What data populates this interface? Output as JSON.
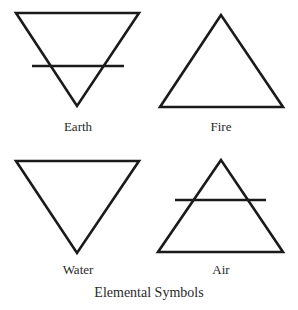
{
  "diagram": {
    "caption": "Elemental Symbols",
    "stroke_color": "#1a1a1a",
    "background_color": "#ffffff",
    "symbols": [
      {
        "name": "Earth",
        "label": "Earth",
        "shape": "downward-triangle-with-crossbar",
        "triangle_points": [
          [
            16,
            13
          ],
          [
            139,
            13
          ],
          [
            77,
            106
          ]
        ],
        "crossbar": [
          [
            32,
            66
          ],
          [
            124,
            66
          ]
        ]
      },
      {
        "name": "Fire",
        "label": "Fire",
        "shape": "upward-triangle",
        "triangle_points": [
          [
            221,
            15
          ],
          [
            160,
            107
          ],
          [
            283,
            107
          ]
        ]
      },
      {
        "name": "Water",
        "label": "Water",
        "shape": "downward-triangle",
        "triangle_points": [
          [
            16,
            161
          ],
          [
            139,
            161
          ],
          [
            77,
            253
          ]
        ]
      },
      {
        "name": "Air",
        "label": "Air",
        "shape": "upward-triangle-with-crossbar",
        "triangle_points": [
          [
            221,
            160
          ],
          [
            158,
            252
          ],
          [
            283,
            252
          ]
        ],
        "crossbar": [
          [
            175,
            200
          ],
          [
            266,
            200
          ]
        ]
      }
    ]
  }
}
